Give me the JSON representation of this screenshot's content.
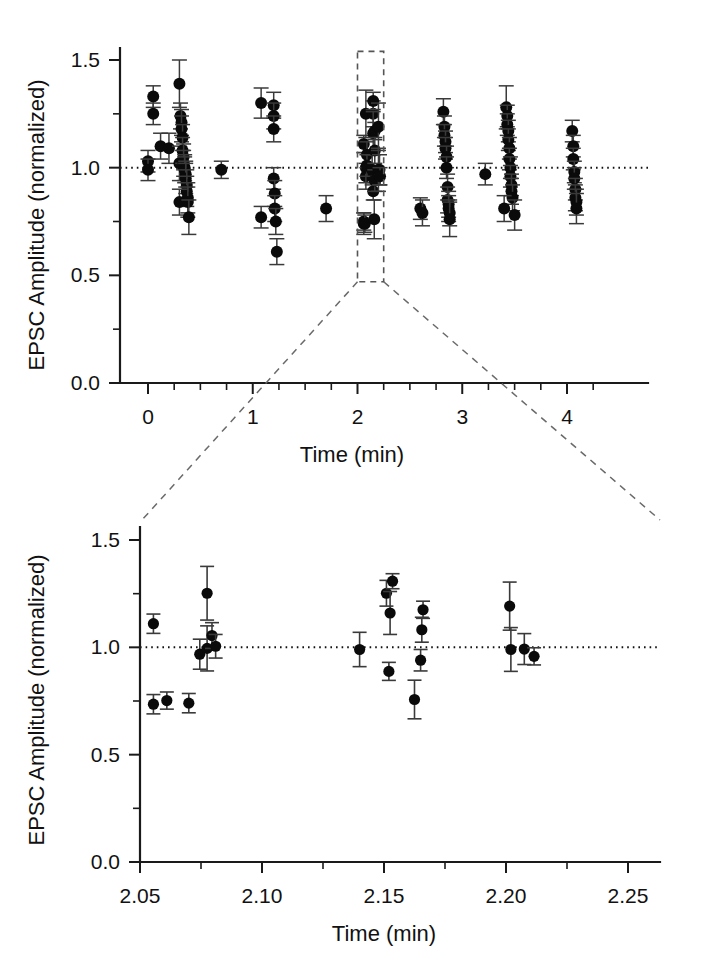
{
  "figure": {
    "background_color": "#ffffff",
    "marker_color": "#0a0a0a",
    "errorbar_color": "#3a3a3a",
    "axis_color": "#1a1a1a",
    "reference_line_value": 1.0
  },
  "chart_data": [
    {
      "type": "scatter",
      "panel": "top",
      "title": "",
      "xlabel": "Time  (min)",
      "ylabel": "EPSC Amplitude  (normalized)",
      "xlim": [
        -0.12,
        4.5
      ],
      "ylim": [
        0.0,
        1.58
      ],
      "xticks": [
        0,
        1,
        2,
        3,
        4
      ],
      "xticklabels": [
        "0",
        "1",
        "2",
        "3",
        "4"
      ],
      "yticks": [
        0.0,
        0.5,
        1.0,
        1.5
      ],
      "yticklabels": [
        "0.0",
        "0.5",
        "1.0",
        "1.5"
      ],
      "x_minor_ticks": [
        0.25,
        0.5,
        0.75,
        1.25,
        1.5,
        1.75,
        2.25,
        2.5,
        2.75,
        3.25,
        3.5,
        3.75,
        4.25
      ],
      "y_minor_ticks": [
        0.25,
        0.75,
        1.25
      ],
      "grid": false,
      "legend": null,
      "reference_line": {
        "y": 1.0,
        "style": "dotted"
      },
      "annotation_box": {
        "label": "zoom-region",
        "x_range": [
          2.0,
          2.25
        ],
        "y_range": [
          0.47,
          1.54
        ],
        "style": "dashed"
      },
      "error_type": "sem",
      "points": [
        {
          "x": 0.0,
          "y": 1.03,
          "err": 0.05
        },
        {
          "x": 0.0,
          "y": 0.99,
          "err": 0.05
        },
        {
          "x": 0.05,
          "y": 1.33,
          "err": 0.05
        },
        {
          "x": 0.05,
          "y": 1.25,
          "err": 0.05
        },
        {
          "x": 0.12,
          "y": 1.1,
          "err": 0.06
        },
        {
          "x": 0.2,
          "y": 1.09,
          "err": 0.07
        },
        {
          "x": 0.3,
          "y": 1.39,
          "err": 0.11
        },
        {
          "x": 0.3,
          "y": 1.02,
          "err": 0.08
        },
        {
          "x": 0.31,
          "y": 1.24,
          "err": 0.06
        },
        {
          "x": 0.32,
          "y": 1.21,
          "err": 0.06
        },
        {
          "x": 0.32,
          "y": 1.18,
          "err": 0.06
        },
        {
          "x": 0.33,
          "y": 1.14,
          "err": 0.06
        },
        {
          "x": 0.33,
          "y": 1.08,
          "err": 0.06
        },
        {
          "x": 0.34,
          "y": 1.05,
          "err": 0.06
        },
        {
          "x": 0.34,
          "y": 1.02,
          "err": 0.06
        },
        {
          "x": 0.35,
          "y": 1.0,
          "err": 0.06
        },
        {
          "x": 0.35,
          "y": 0.99,
          "err": 0.06
        },
        {
          "x": 0.36,
          "y": 0.97,
          "err": 0.06
        },
        {
          "x": 0.36,
          "y": 0.95,
          "err": 0.07
        },
        {
          "x": 0.37,
          "y": 0.92,
          "err": 0.07
        },
        {
          "x": 0.37,
          "y": 0.89,
          "err": 0.07
        },
        {
          "x": 0.38,
          "y": 0.86,
          "err": 0.07
        },
        {
          "x": 0.3,
          "y": 0.84,
          "err": 0.06
        },
        {
          "x": 0.38,
          "y": 0.84,
          "err": 0.07
        },
        {
          "x": 0.39,
          "y": 0.77,
          "err": 0.08
        },
        {
          "x": 0.7,
          "y": 0.99,
          "err": 0.04
        },
        {
          "x": 1.08,
          "y": 1.3,
          "err": 0.07
        },
        {
          "x": 1.08,
          "y": 0.77,
          "err": 0.05
        },
        {
          "x": 1.2,
          "y": 1.29,
          "err": 0.06
        },
        {
          "x": 1.2,
          "y": 1.24,
          "err": 0.06
        },
        {
          "x": 1.2,
          "y": 1.18,
          "err": 0.06
        },
        {
          "x": 1.2,
          "y": 0.95,
          "err": 0.05
        },
        {
          "x": 1.21,
          "y": 0.88,
          "err": 0.06
        },
        {
          "x": 1.21,
          "y": 0.81,
          "err": 0.06
        },
        {
          "x": 1.22,
          "y": 0.75,
          "err": 0.06
        },
        {
          "x": 1.23,
          "y": 0.61,
          "err": 0.06
        },
        {
          "x": 1.7,
          "y": 0.81,
          "err": 0.06
        },
        {
          "x": 2.06,
          "y": 1.11,
          "err": 0.04
        },
        {
          "x": 2.06,
          "y": 0.74,
          "err": 0.05
        },
        {
          "x": 2.06,
          "y": 0.75,
          "err": 0.04
        },
        {
          "x": 2.07,
          "y": 0.74,
          "err": 0.04
        },
        {
          "x": 2.08,
          "y": 1.25,
          "err": 0.11
        },
        {
          "x": 2.08,
          "y": 0.96,
          "err": 0.06
        },
        {
          "x": 2.08,
          "y": 1.0,
          "err": 0.07
        },
        {
          "x": 2.09,
          "y": 1.06,
          "err": 0.06
        },
        {
          "x": 2.09,
          "y": 1.01,
          "err": 0.05
        },
        {
          "x": 2.14,
          "y": 0.99,
          "err": 0.07
        },
        {
          "x": 2.15,
          "y": 1.25,
          "err": 0.06
        },
        {
          "x": 2.15,
          "y": 1.31,
          "err": 0.04
        },
        {
          "x": 2.15,
          "y": 1.16,
          "err": 0.1
        },
        {
          "x": 2.15,
          "y": 0.89,
          "err": 0.04
        },
        {
          "x": 2.16,
          "y": 0.76,
          "err": 0.09
        },
        {
          "x": 2.165,
          "y": 1.17,
          "err": 0.04
        },
        {
          "x": 2.165,
          "y": 1.08,
          "err": 0.06
        },
        {
          "x": 2.165,
          "y": 0.94,
          "err": 0.05
        },
        {
          "x": 2.2,
          "y": 1.19,
          "err": 0.11
        },
        {
          "x": 2.2,
          "y": 0.99,
          "err": 0.1
        },
        {
          "x": 2.21,
          "y": 0.99,
          "err": 0.07
        },
        {
          "x": 2.215,
          "y": 0.96,
          "err": 0.04
        },
        {
          "x": 2.6,
          "y": 0.81,
          "err": 0.05
        },
        {
          "x": 2.62,
          "y": 0.79,
          "err": 0.06
        },
        {
          "x": 2.82,
          "y": 1.26,
          "err": 0.06
        },
        {
          "x": 2.83,
          "y": 1.19,
          "err": 0.05
        },
        {
          "x": 2.83,
          "y": 1.15,
          "err": 0.05
        },
        {
          "x": 2.84,
          "y": 1.12,
          "err": 0.05
        },
        {
          "x": 2.84,
          "y": 1.09,
          "err": 0.05
        },
        {
          "x": 2.85,
          "y": 1.05,
          "err": 0.05
        },
        {
          "x": 2.85,
          "y": 1.0,
          "err": 0.05
        },
        {
          "x": 2.86,
          "y": 0.91,
          "err": 0.06
        },
        {
          "x": 2.86,
          "y": 0.85,
          "err": 0.06
        },
        {
          "x": 2.87,
          "y": 0.83,
          "err": 0.06
        },
        {
          "x": 2.87,
          "y": 0.81,
          "err": 0.06
        },
        {
          "x": 2.88,
          "y": 0.79,
          "err": 0.06
        },
        {
          "x": 2.88,
          "y": 0.76,
          "err": 0.08
        },
        {
          "x": 3.22,
          "y": 0.97,
          "err": 0.05
        },
        {
          "x": 3.42,
          "y": 1.28,
          "err": 0.1
        },
        {
          "x": 3.43,
          "y": 1.24,
          "err": 0.05
        },
        {
          "x": 3.43,
          "y": 1.2,
          "err": 0.05
        },
        {
          "x": 3.44,
          "y": 1.17,
          "err": 0.05
        },
        {
          "x": 3.44,
          "y": 1.13,
          "err": 0.05
        },
        {
          "x": 3.45,
          "y": 1.09,
          "err": 0.05
        },
        {
          "x": 3.45,
          "y": 1.04,
          "err": 0.05
        },
        {
          "x": 3.46,
          "y": 1.0,
          "err": 0.05
        },
        {
          "x": 3.46,
          "y": 0.96,
          "err": 0.05
        },
        {
          "x": 3.47,
          "y": 0.92,
          "err": 0.05
        },
        {
          "x": 3.47,
          "y": 0.89,
          "err": 0.06
        },
        {
          "x": 3.48,
          "y": 0.86,
          "err": 0.06
        },
        {
          "x": 3.4,
          "y": 0.81,
          "err": 0.06
        },
        {
          "x": 3.5,
          "y": 0.78,
          "err": 0.07
        },
        {
          "x": 4.05,
          "y": 1.17,
          "err": 0.05
        },
        {
          "x": 4.06,
          "y": 1.1,
          "err": 0.05
        },
        {
          "x": 4.06,
          "y": 1.04,
          "err": 0.05
        },
        {
          "x": 4.07,
          "y": 0.98,
          "err": 0.05
        },
        {
          "x": 4.07,
          "y": 0.95,
          "err": 0.05
        },
        {
          "x": 4.08,
          "y": 0.9,
          "err": 0.05
        },
        {
          "x": 4.08,
          "y": 0.86,
          "err": 0.06
        },
        {
          "x": 4.09,
          "y": 0.84,
          "err": 0.06
        },
        {
          "x": 4.09,
          "y": 0.81,
          "err": 0.07
        }
      ]
    },
    {
      "type": "scatter",
      "panel": "bottom",
      "title": "",
      "xlabel": "Time (min)",
      "ylabel": "EPSC Amplitude  (normalized)",
      "xlim": [
        2.05,
        2.25
      ],
      "ylim": [
        0.0,
        1.58
      ],
      "xticks": [
        2.05,
        2.1,
        2.15,
        2.2,
        2.25
      ],
      "xticklabels": [
        "2.05",
        "2.10",
        "2.15",
        "2.20",
        "2.25"
      ],
      "yticks": [
        0.0,
        0.5,
        1.0,
        1.5
      ],
      "yticklabels": [
        "0.0",
        "0.5",
        "1.0",
        "1.5"
      ],
      "x_minor_ticks": [
        2.075,
        2.125,
        2.175,
        2.225
      ],
      "y_minor_ticks": [
        0.25,
        0.75,
        1.25
      ],
      "grid": false,
      "legend": null,
      "reference_line": {
        "y": 1.0,
        "style": "dotted"
      },
      "error_type": "sem",
      "points": [
        {
          "x": 2.0555,
          "y": 1.11,
          "err": 0.045
        },
        {
          "x": 2.0555,
          "y": 0.735,
          "err": 0.045
        },
        {
          "x": 2.061,
          "y": 0.752,
          "err": 0.04
        },
        {
          "x": 2.07,
          "y": 0.74,
          "err": 0.045
        },
        {
          "x": 2.0745,
          "y": 0.968,
          "err": 0.07
        },
        {
          "x": 2.0775,
          "y": 1.252,
          "err": 0.125
        },
        {
          "x": 2.0775,
          "y": 0.995,
          "err": 0.105
        },
        {
          "x": 2.0795,
          "y": 1.055,
          "err": 0.06
        },
        {
          "x": 2.081,
          "y": 1.005,
          "err": 0.055
        },
        {
          "x": 2.14,
          "y": 0.99,
          "err": 0.08
        },
        {
          "x": 2.151,
          "y": 1.252,
          "err": 0.06
        },
        {
          "x": 2.1535,
          "y": 1.308,
          "err": 0.035
        },
        {
          "x": 2.1525,
          "y": 1.16,
          "err": 0.1
        },
        {
          "x": 2.152,
          "y": 0.888,
          "err": 0.042
        },
        {
          "x": 2.1625,
          "y": 0.757,
          "err": 0.09
        },
        {
          "x": 2.166,
          "y": 1.175,
          "err": 0.04
        },
        {
          "x": 2.1655,
          "y": 1.082,
          "err": 0.058
        },
        {
          "x": 2.165,
          "y": 0.94,
          "err": 0.05
        },
        {
          "x": 2.2015,
          "y": 1.192,
          "err": 0.112
        },
        {
          "x": 2.202,
          "y": 0.99,
          "err": 0.102
        },
        {
          "x": 2.2075,
          "y": 0.992,
          "err": 0.072
        },
        {
          "x": 2.2115,
          "y": 0.958,
          "err": 0.04
        }
      ]
    }
  ]
}
